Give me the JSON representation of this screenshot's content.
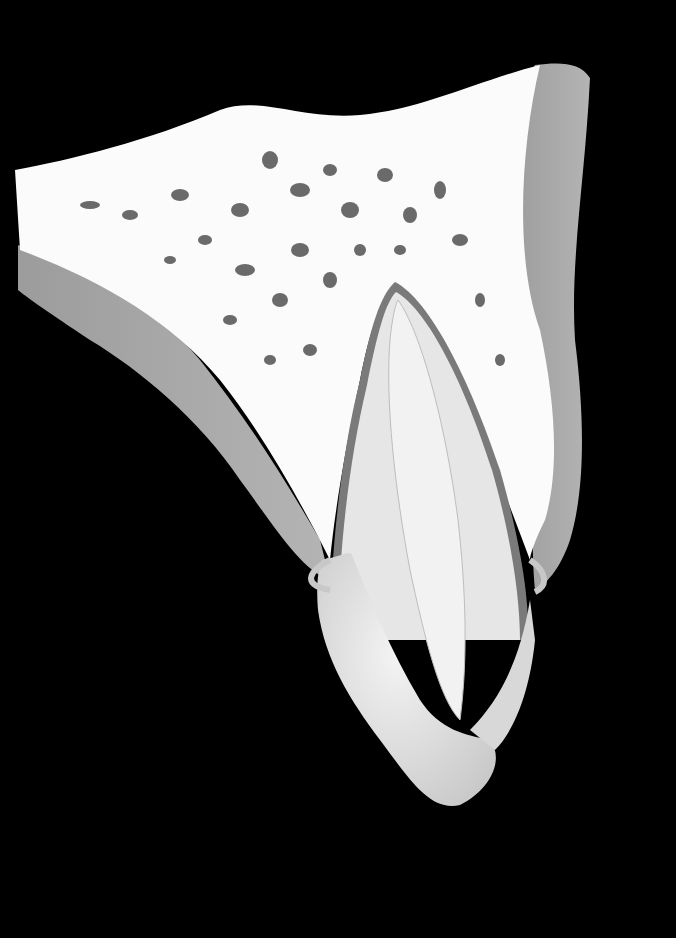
{
  "illustration": {
    "subject": "tooth-in-alveolar-bone-cross-section",
    "colors": {
      "background": "#000000",
      "border": "#ffffff",
      "bone": "#fbfbfb",
      "bone_pores": "#6a6a6a",
      "soft_tissue": "#a9a9a9",
      "gingiva_edge": "#c8c8c8",
      "root": "#e6e6e6",
      "pulp": "#f2f2f2",
      "enamel": "#e0e0e0",
      "ligament": "#7a7a7a"
    }
  }
}
